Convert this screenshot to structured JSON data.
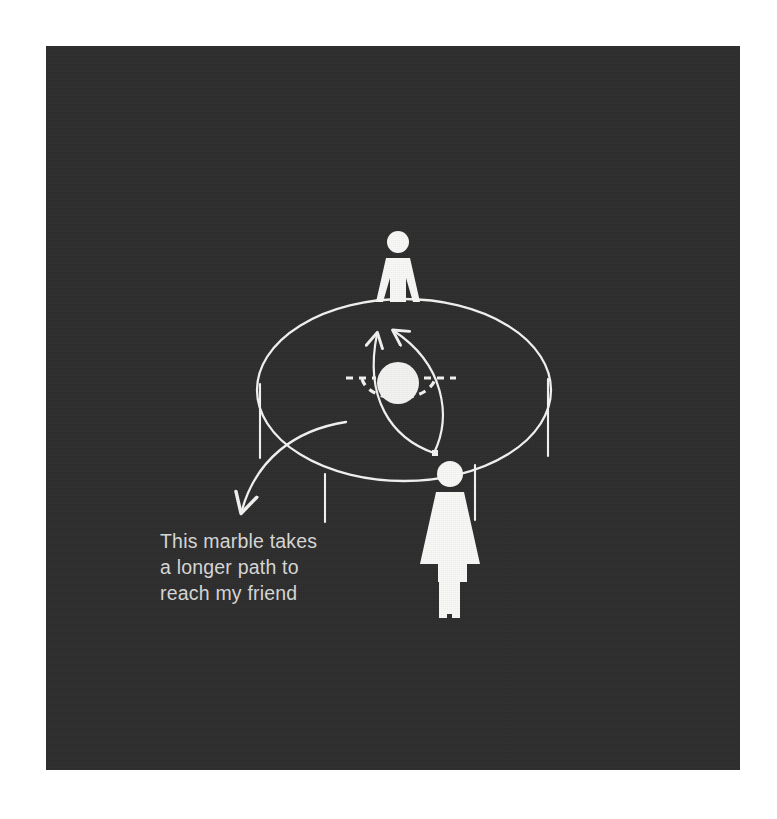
{
  "page": {
    "background_color": "#ffffff",
    "panel_background_color": "#2e2e2e",
    "ink_color": "#f2f2f0",
    "caption_color": "#d8d8d6"
  },
  "illustration": {
    "title": "Gravity well trampoline diagram",
    "caption": "This marble takes\na longer path to\nreach my friend",
    "elements": {
      "fabric_label": "trampoline-fabric-ellipse",
      "marble_label": "marble-sphere",
      "depression_label": "marble-depression-dashed-ellipse",
      "path_left_label": "geodesic-path-left",
      "path_right_label": "geodesic-path-right",
      "long_path_label": "long-curved-path-arrow",
      "friend_label": "friend-figure",
      "observer_label": "observer-figure"
    }
  },
  "chart_data": {
    "type": "diagram",
    "annotations": [
      {
        "text": "This marble takes a longer path to reach my friend",
        "points_to": "long-curved-path-arrow",
        "position": "lower-left"
      }
    ],
    "objects": [
      {
        "name": "trampoline-fabric-ellipse",
        "shape": "ellipse",
        "cx": 358,
        "cy": 344,
        "rx": 146,
        "ry": 91
      },
      {
        "name": "marble-sphere",
        "shape": "circle",
        "cx": 352,
        "cy": 337,
        "r": 21
      },
      {
        "name": "marble-depression-dashed-ellipse",
        "shape": "dashed-ellipse",
        "cx": 352,
        "cy": 340,
        "rx": 36,
        "ry": 22
      },
      {
        "name": "geodesic-path-left",
        "shape": "curve",
        "from": [
          389,
          406
        ],
        "to": [
          339,
          276
        ],
        "arrow": true
      },
      {
        "name": "geodesic-path-right",
        "shape": "curve",
        "from": [
          389,
          406
        ],
        "to": [
          352,
          274
        ],
        "arrow": true
      },
      {
        "name": "long-curved-path-arrow",
        "shape": "curve",
        "from": [
          299,
          376
        ],
        "to": [
          194,
          466
        ],
        "arrow": true
      },
      {
        "name": "friend-figure",
        "shape": "person",
        "cx": 352,
        "cy": 210
      },
      {
        "name": "observer-figure",
        "shape": "person",
        "cx": 404,
        "cy": 470
      },
      {
        "name": "fabric-leg-far-left",
        "shape": "line",
        "x": 214,
        "y1": 338,
        "y2": 410
      },
      {
        "name": "fabric-leg-front-left",
        "shape": "line",
        "x": 279,
        "y1": 428,
        "y2": 474
      },
      {
        "name": "fabric-leg-far-right",
        "shape": "line",
        "x": 502,
        "y1": 334,
        "y2": 410
      },
      {
        "name": "fabric-leg-front-right",
        "shape": "line",
        "x": 429,
        "y1": 420,
        "y2": 474
      }
    ]
  }
}
